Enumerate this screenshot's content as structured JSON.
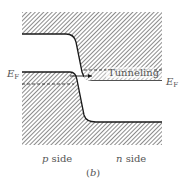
{
  "figure": {
    "panel_label": "(b)",
    "panel_letter": "b",
    "labels": {
      "fermi_left": "E",
      "fermi_left_sub": "F",
      "fermi_right": "E",
      "fermi_right_sub": "F",
      "tunneling": "Tunneling",
      "p_side": "p",
      "p_side_suffix": " side",
      "n_side": "n",
      "n_side_suffix": " side"
    },
    "colors": {
      "hatch": "#6e6e6e",
      "edge": "#1a1a1a",
      "background": "#ffffff",
      "text": "#555555"
    },
    "regions": [
      {
        "name": "conduction-band",
        "description": "upper hatched region (empty states)"
      },
      {
        "name": "valence-band",
        "description": "lower hatched region (filled states)"
      },
      {
        "name": "tunneling-window",
        "description": "band between dashed line and n-side conduction edge"
      }
    ]
  }
}
